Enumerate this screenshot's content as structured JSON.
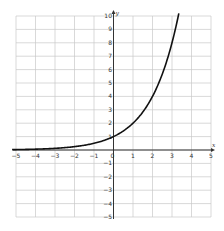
{
  "chart_data": {
    "type": "line",
    "title": "",
    "xlabel": "x",
    "ylabel": "y",
    "xlim": [
      -5,
      5
    ],
    "ylim": [
      -5,
      10
    ],
    "grid": true,
    "x_ticks": [
      -5,
      -4,
      -3,
      -2,
      -1,
      0,
      1,
      2,
      3,
      4,
      5
    ],
    "y_ticks": [
      -5,
      -4,
      -3,
      -2,
      -1,
      1,
      2,
      3,
      4,
      5,
      6,
      7,
      8,
      9,
      10
    ],
    "series": [
      {
        "name": "y = 2^x",
        "function": "2^x",
        "x": [
          -5,
          -4,
          -3,
          -2,
          -1,
          0,
          1,
          2,
          3,
          3.32
        ],
        "values": [
          0.03125,
          0.0625,
          0.125,
          0.25,
          0.5,
          1,
          2,
          4,
          8,
          10
        ],
        "color": "#111111"
      }
    ],
    "legend": null
  },
  "colors": {
    "grid": "#c8c8c8",
    "axis": "#333333",
    "curve": "#111111"
  }
}
